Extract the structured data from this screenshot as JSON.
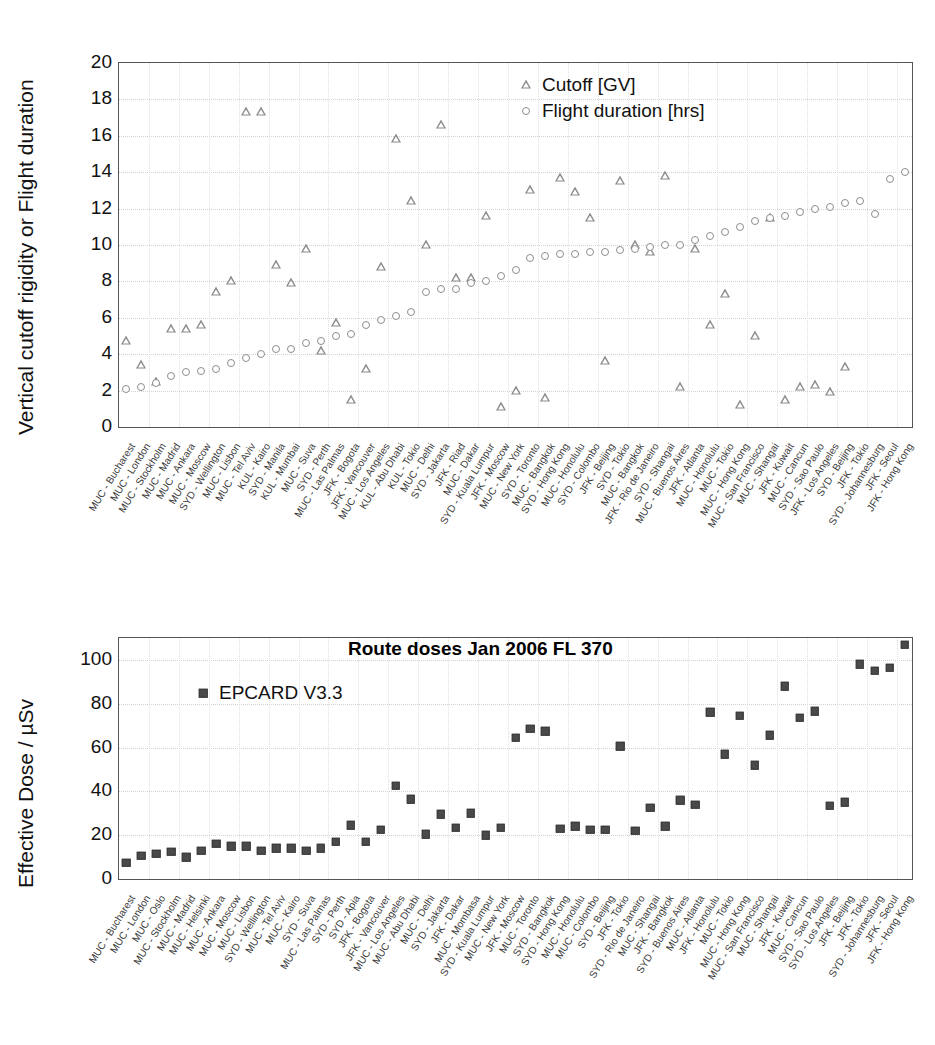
{
  "chart_data": [
    {
      "type": "scatter",
      "id": "cutoff-flightduration",
      "title": "",
      "xlabel": "",
      "ylabel": "Vertical cutoff rigidity or Flight duration",
      "ylim": [
        0,
        20
      ],
      "yticks": [
        0,
        2,
        4,
        6,
        8,
        10,
        12,
        14,
        16,
        18,
        20
      ],
      "grid": true,
      "legend_position": "top-right",
      "legend": [
        "Cutoff [GV]",
        "Flight duration [hrs]"
      ],
      "categories": [
        "MUC - Bucharest",
        "MUC - London",
        "MUC - Stockholm",
        "MUC - Madrid",
        "MUC - Ankara",
        "MUC - Moscow",
        "SYD - Wellington",
        "MUC - Lisbon",
        "MUC - Tel Aviv",
        "KUL - Kairo",
        "SYD - Manila",
        "KUL - Mumbai",
        "MUC - Suva",
        "SYD - Perth",
        "MUC - Las Palmas",
        "JFK - Bogota",
        "JFK - Vancouver",
        "MUC - Los Angeles",
        "KUL - Abu Dhabi",
        "KUL - Tokio",
        "MUC - Delhi",
        "SYD - Jakarta",
        "JFK - Riad",
        "MUC - Dakar",
        "SYD - Kuala Lumpur",
        "JFK - Moscow",
        "MUC - New York",
        "SYD - Toronto",
        "MUC - Bangkok",
        "SYD - Hong Kong",
        "MUC - Honolulu",
        "SYD - Colombo",
        "JFK - Beijing",
        "SYD - Tokio",
        "MUC - Bangkok",
        "JFK - Rio de Janeiro",
        "SYD - Shangai",
        "MUC - Buenos Aires",
        "JFK - Atlanta",
        "MUC - Honolulu",
        "MUC - Tokio",
        "MUC - Hong Kong",
        "MUC - San Francisco",
        "MUC - Shangai",
        "JFK - Kuwait",
        "MUC - Cancun",
        "SYD - Sao Paulo",
        "JFK - Los Angeles",
        "SYD - Beijing",
        "JFK - Tokio",
        "SYD - Johannesburg",
        "JFK - Seoul",
        "JFK - Hong Kong"
      ],
      "series": [
        {
          "name": "Cutoff [GV]",
          "marker": "triangle",
          "color": "#8a8a8a",
          "values": [
            4.7,
            3.4,
            2.5,
            5.4,
            5.4,
            5.6,
            7.4,
            8.0,
            17.3,
            17.3,
            8.9,
            7.9,
            9.8,
            4.2,
            5.7,
            1.5,
            3.2,
            8.8,
            15.8,
            12.4,
            10.0,
            16.6,
            8.2,
            8.2,
            11.6,
            1.1,
            2.0,
            13.0,
            1.6,
            13.7,
            12.9,
            11.5,
            3.6,
            13.5,
            10.0,
            9.6,
            13.8,
            2.2,
            9.8,
            5.6,
            7.3,
            1.2,
            5.0,
            11.5,
            1.5,
            2.2,
            2.3,
            1.9,
            3.3
          ]
        },
        {
          "name": "Flight duration [hrs]",
          "marker": "circle",
          "color": "#8d8d8d",
          "values": [
            2.1,
            2.2,
            2.4,
            2.8,
            3.0,
            3.1,
            3.2,
            3.5,
            3.8,
            4.0,
            4.3,
            4.3,
            4.6,
            4.7,
            5.0,
            5.1,
            5.6,
            5.9,
            6.1,
            6.3,
            7.4,
            7.6,
            7.6,
            7.9,
            8.0,
            8.3,
            8.6,
            9.3,
            9.4,
            9.5,
            9.5,
            9.6,
            9.6,
            9.7,
            9.8,
            9.9,
            10.0,
            10.0,
            10.3,
            10.5,
            10.7,
            11.0,
            11.3,
            11.5,
            11.6,
            11.8,
            12.0,
            12.1,
            12.3,
            12.4,
            11.7,
            13.6,
            14.0,
            14.1,
            14.7,
            16.5
          ]
        }
      ]
    },
    {
      "type": "scatter",
      "id": "route-doses",
      "title": "Route doses Jan 2006 FL 370",
      "xlabel": "",
      "ylabel": "Effective Dose / µSv",
      "ylim": [
        0,
        110
      ],
      "yticks": [
        0,
        20,
        40,
        60,
        80,
        100
      ],
      "grid": true,
      "legend_position": "top-left",
      "legend": [
        "EPCARD V3.3"
      ],
      "categories": [
        "MUC - Bucharest",
        "MUC - London",
        "MUC - Oslo",
        "MUC - Stockholm",
        "MUC - Madrid",
        "MUC - Helsinki",
        "MUC - Ankara",
        "MUC - Moscow",
        "MUC - Lisbon",
        "SYD - Wellington",
        "MUC - Tel Aviv",
        "MUC - Kairo",
        "SYD - Suva",
        "MUC - Las Palmas",
        "SYD - Perth",
        "SYD - Apia",
        "JFK - Bogota",
        "JFK - Vancouver",
        "MUC - Los Angeles",
        "MUC - Abu Dhabi",
        "MUC - Delhi",
        "SYD - Jakarta",
        "JFK - Dakar",
        "MUC - Mombasa",
        "SYD - Kuala Lumpur",
        "MUC - New York",
        "JFK - Moscow",
        "MUC - Toronto",
        "SYD - Bangkok",
        "SYD - Hong Kong",
        "MUC - Honolulu",
        "MUC - Colombo",
        "SYD - Beijing",
        "JFK - Tokio",
        "SYD - Rio de Janeiro",
        "MUC - Shangai",
        "JFK - Bangkok",
        "SYD - Buenos Aires",
        "MUC - Atlanta",
        "JFK - Honolulu",
        "MUC - Tokio",
        "MUC - Hong Kong",
        "MUC - San Francisco",
        "MUC - Shangai",
        "JFK - Kuwait",
        "MUC - Cancun",
        "SYD - Sao Paulo",
        "SYD - Los Angeles",
        "JFK - Beijing",
        "JFK - Tokio",
        "SYD - Johannesburg",
        "JFK - Seoul",
        "JFK - Hong Kong"
      ],
      "series": [
        {
          "name": "EPCARD V3.3",
          "marker": "square",
          "color": "#4a4a4a",
          "values": [
            7.5,
            10.5,
            11.5,
            12.5,
            10.0,
            13.0,
            16.0,
            15.0,
            15.0,
            13.0,
            14.0,
            14.0,
            13.0,
            14.0,
            17.0,
            24.5,
            17.0,
            22.5,
            42.5,
            36.5,
            20.5,
            29.5,
            23.5,
            30.0,
            20.0,
            23.5,
            64.5,
            68.5,
            67.5,
            23.0,
            24.0,
            22.5,
            22.5,
            60.5,
            22.0,
            32.5,
            24.0,
            36.0,
            34.0,
            76.0,
            57.0,
            74.5,
            52.0,
            65.5,
            88.0,
            73.5,
            76.5,
            33.5,
            35.0,
            98.0,
            95.0,
            96.5,
            107.0
          ]
        }
      ]
    }
  ]
}
